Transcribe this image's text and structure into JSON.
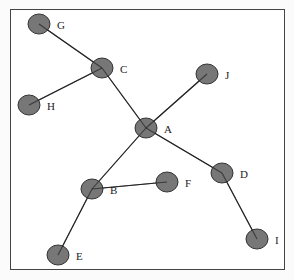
{
  "diagram": {
    "type": "tree-graph",
    "nodes": [
      {
        "id": "G",
        "label": "G",
        "x": 39,
        "y": 24
      },
      {
        "id": "C",
        "label": "C",
        "x": 102,
        "y": 68
      },
      {
        "id": "H",
        "label": "H",
        "x": 29,
        "y": 105
      },
      {
        "id": "J",
        "label": "J",
        "x": 207,
        "y": 74
      },
      {
        "id": "A",
        "label": "A",
        "x": 146,
        "y": 128
      },
      {
        "id": "D",
        "label": "D",
        "x": 222,
        "y": 173
      },
      {
        "id": "F",
        "label": "F",
        "x": 167,
        "y": 182
      },
      {
        "id": "B",
        "label": "B",
        "x": 92,
        "y": 189
      },
      {
        "id": "E",
        "label": "E",
        "x": 58,
        "y": 255
      },
      {
        "id": "I",
        "label": "I",
        "x": 257,
        "y": 239
      }
    ],
    "edges": [
      [
        "G",
        "C"
      ],
      [
        "C",
        "H"
      ],
      [
        "C",
        "A"
      ],
      [
        "A",
        "J"
      ],
      [
        "A",
        "D"
      ],
      [
        "A",
        "B"
      ],
      [
        "B",
        "F"
      ],
      [
        "B",
        "E"
      ],
      [
        "D",
        "I"
      ]
    ],
    "colors": {
      "node_fill": "#6b6b6b",
      "edge": "#222222",
      "frame": "#444444"
    }
  }
}
